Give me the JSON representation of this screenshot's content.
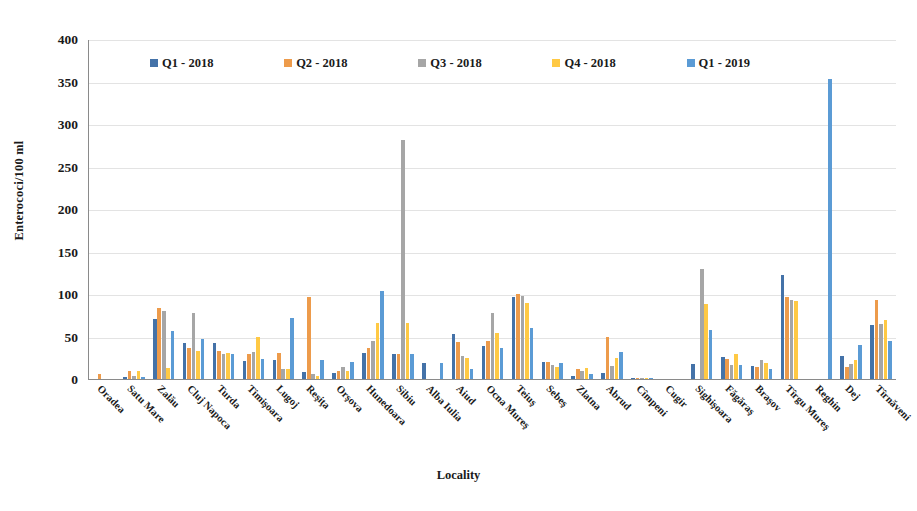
{
  "chart_data": {
    "type": "bar",
    "title": "",
    "xlabel": "Locality",
    "ylabel": "Enterococi/100 ml",
    "ylim": [
      0,
      400
    ],
    "ytick_step": 50,
    "yticks": [
      "400",
      "350",
      "300",
      "250",
      "200",
      "150",
      "100",
      "50",
      "0"
    ],
    "grid": true,
    "legend_position": "top-inside",
    "categories": [
      "Oradea",
      "Satu Mare",
      "Zalău",
      "Cluj Napoca",
      "Turda",
      "Timişoara",
      "Lugoj",
      "Reşiţa",
      "Orşova",
      "Hunedoara",
      "Sibiu",
      "Alba Iulia",
      "Aiud",
      "Ocna Mureş",
      "Teiuş",
      "Sebeş",
      "Zlatna",
      "Abrud",
      "Cîmpeni",
      "Cugir",
      "Sighişoara",
      "Făgăraş",
      "Braşov",
      "Tîrgu Mureş",
      "Reghin",
      "Dej",
      "Tîrnăveni"
    ],
    "series": [
      {
        "name": "Q1 - 2018",
        "color": "#4472a8",
        "values": [
          0,
          2,
          71,
          42,
          42,
          21,
          22,
          8,
          7,
          31,
          30,
          19,
          53,
          39,
          97,
          20,
          4,
          7,
          1,
          0,
          18,
          26,
          15,
          122,
          0,
          27,
          63
        ]
      },
      {
        "name": "Q2 - 2018",
        "color": "#ed9b4b",
        "values": [
          6,
          9,
          84,
          37,
          33,
          29,
          31,
          97,
          10,
          37,
          30,
          0,
          43,
          45,
          100,
          20,
          12,
          50,
          1,
          0,
          0,
          24,
          14,
          97,
          0,
          14,
          93
        ]
      },
      {
        "name": "Q3 - 2018",
        "color": "#a6a6a6",
        "values": [
          0,
          4,
          80,
          78,
          30,
          32,
          12,
          6,
          14,
          45,
          281,
          0,
          27,
          78,
          98,
          16,
          10,
          15,
          1,
          0,
          130,
          17,
          22,
          93,
          0,
          18,
          65
        ]
      },
      {
        "name": "Q4 - 2018",
        "color": "#ffc944",
        "values": [
          0,
          10,
          13,
          33,
          31,
          50,
          12,
          4,
          10,
          66,
          66,
          0,
          25,
          54,
          90,
          14,
          13,
          25,
          1,
          0,
          88,
          29,
          19,
          92,
          0,
          22,
          70
        ]
      },
      {
        "name": "Q1 - 2019",
        "color": "#5b9bd5",
        "values": [
          0,
          2,
          56,
          47,
          30,
          23,
          72,
          22,
          20,
          103,
          30,
          19,
          12,
          36,
          60,
          19,
          6,
          32,
          1,
          0,
          58,
          17,
          12,
          0,
          353,
          40,
          45
        ]
      }
    ]
  }
}
